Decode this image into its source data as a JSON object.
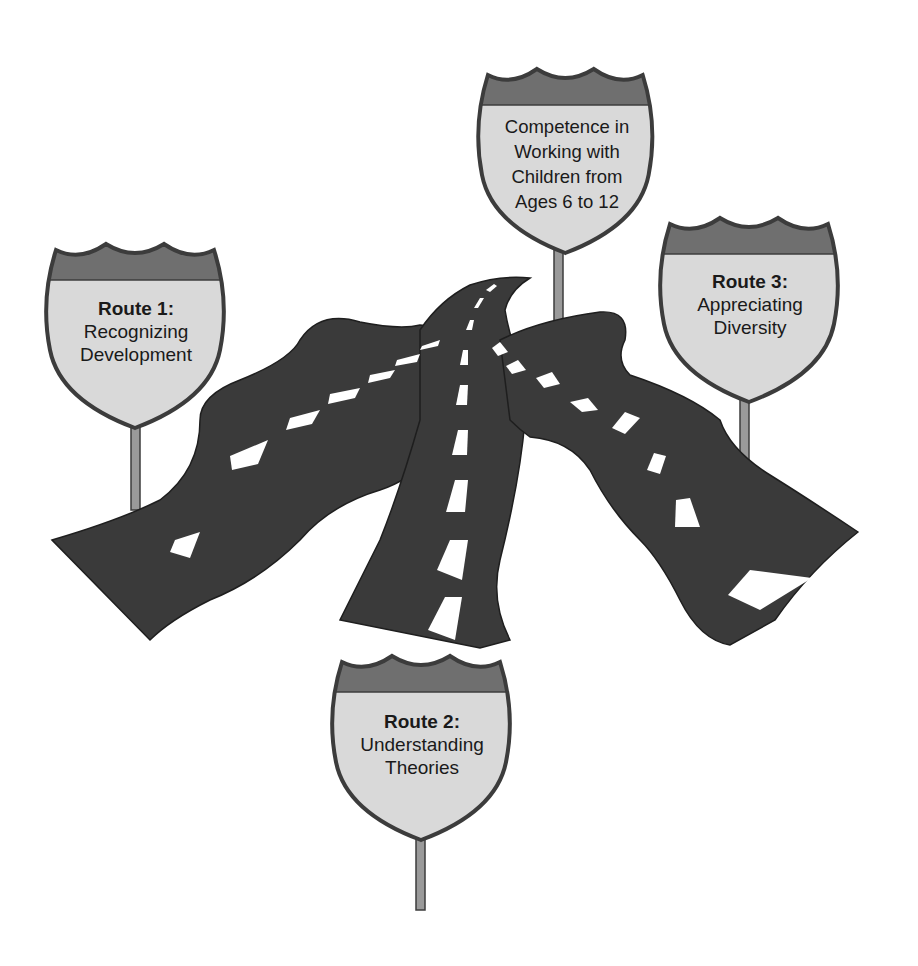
{
  "figure": {
    "colors": {
      "road": "#3a3a3a",
      "lane_marking": "#ffffff",
      "shield_band": "#6f6f6f",
      "shield_face": "#d9d9d9",
      "shield_outline": "#3c3c3c",
      "pole": "#9a9a9a",
      "background": "#ffffff"
    },
    "goal_sign": {
      "lines": [
        "Competence in",
        "Working with",
        "Children from",
        "Ages 6 to 12"
      ]
    },
    "routes": [
      {
        "title": "Route 1:",
        "lines": [
          "Recognizing",
          "Development"
        ]
      },
      {
        "title": "Route 2:",
        "lines": [
          "Understanding",
          "Theories"
        ]
      },
      {
        "title": "Route 3:",
        "lines": [
          "Appreciating",
          "Diversity"
        ]
      }
    ]
  }
}
